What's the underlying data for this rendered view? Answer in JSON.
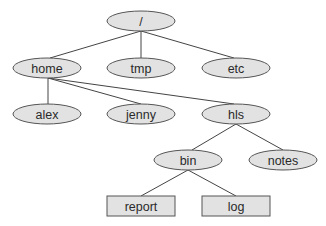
{
  "diagram": {
    "colors": {
      "node_fill": "#e2e2e2",
      "node_stroke": "#555555",
      "edge": "#444444",
      "background": "#ffffff"
    },
    "nodes": [
      {
        "id": "root",
        "label": "/",
        "shape": "ellipse",
        "cx": 141,
        "cy": 21
      },
      {
        "id": "home",
        "label": "home",
        "shape": "ellipse",
        "cx": 47,
        "cy": 68
      },
      {
        "id": "tmp",
        "label": "tmp",
        "shape": "ellipse",
        "cx": 141,
        "cy": 68
      },
      {
        "id": "etc",
        "label": "etc",
        "shape": "ellipse",
        "cx": 236,
        "cy": 68
      },
      {
        "id": "alex",
        "label": "alex",
        "shape": "ellipse",
        "cx": 47,
        "cy": 114
      },
      {
        "id": "jenny",
        "label": "jenny",
        "shape": "ellipse",
        "cx": 141,
        "cy": 114
      },
      {
        "id": "hls",
        "label": "hls",
        "shape": "ellipse",
        "cx": 236,
        "cy": 114
      },
      {
        "id": "bin",
        "label": "bin",
        "shape": "ellipse",
        "cx": 188,
        "cy": 160
      },
      {
        "id": "notes",
        "label": "notes",
        "shape": "ellipse",
        "cx": 283,
        "cy": 160
      },
      {
        "id": "report",
        "label": "report",
        "shape": "rect",
        "cx": 141,
        "cy": 206
      },
      {
        "id": "log",
        "label": "log",
        "shape": "rect",
        "cx": 236,
        "cy": 206
      }
    ],
    "edges": [
      {
        "from": "root",
        "to": "home"
      },
      {
        "from": "root",
        "to": "tmp"
      },
      {
        "from": "root",
        "to": "etc"
      },
      {
        "from": "home",
        "to": "alex"
      },
      {
        "from": "home",
        "to": "jenny"
      },
      {
        "from": "home",
        "to": "hls"
      },
      {
        "from": "hls",
        "to": "bin"
      },
      {
        "from": "hls",
        "to": "notes"
      },
      {
        "from": "bin",
        "to": "report"
      },
      {
        "from": "bin",
        "to": "log"
      }
    ]
  }
}
